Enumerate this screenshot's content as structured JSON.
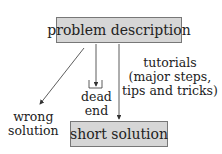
{
  "diagram": {
    "top_box": {
      "label": "problem description"
    },
    "bottom_box": {
      "label": "short solution"
    },
    "branches": [
      {
        "id": "wrong",
        "lines": [
          "wrong",
          "solution"
        ]
      },
      {
        "id": "dead",
        "lines": [
          "dead",
          "end"
        ]
      },
      {
        "id": "tutorials",
        "lines": [
          "tutorials",
          "(major steps,",
          "tips and tricks)"
        ]
      }
    ],
    "colors": {
      "box_fill": "#d6d6d6",
      "box_border": "#777777",
      "line": "#333333"
    }
  }
}
